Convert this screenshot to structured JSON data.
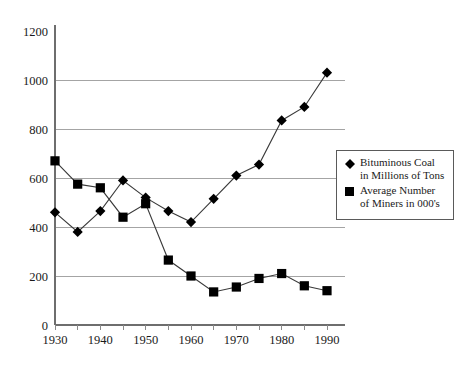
{
  "chart_data": {
    "type": "line",
    "title": "",
    "subtitle": "",
    "xlabel": "",
    "ylabel": "",
    "x": [
      1930,
      1935,
      1940,
      1945,
      1950,
      1955,
      1960,
      1965,
      1970,
      1975,
      1980,
      1985,
      1990
    ],
    "xlim": [
      1930,
      1990
    ],
    "ylim": [
      0,
      1200
    ],
    "y_ticks": [
      0,
      200,
      400,
      600,
      800,
      1000,
      1200
    ],
    "y_tick_labels": [
      "0",
      "200",
      "400",
      "600",
      "800",
      "1000",
      "1200"
    ],
    "x_ticks": [
      1930,
      1935,
      1940,
      1945,
      1950,
      1955,
      1960,
      1965,
      1970,
      1975,
      1980,
      1985,
      1990
    ],
    "x_tick_labels": [
      "1930",
      "",
      "1940",
      "",
      "1950",
      "",
      "1960",
      "",
      "1970",
      "",
      "1980",
      "",
      "1990"
    ],
    "x_major_labels": [
      "1930",
      "1940",
      "1950",
      "1960",
      "1970",
      "1980",
      "1990"
    ],
    "grid": "horizontal",
    "legend_position": "right",
    "series": [
      {
        "name": "Bituminous Coal in Millions of Tons",
        "marker": "diamond",
        "color": "#000000",
        "values": [
          460,
          380,
          465,
          590,
          520,
          465,
          420,
          515,
          610,
          655,
          835,
          890,
          1030
        ]
      },
      {
        "name": "Average Number of Miners in 000's",
        "marker": "square",
        "color": "#000000",
        "values": [
          670,
          575,
          560,
          440,
          495,
          265,
          200,
          135,
          155,
          190,
          210,
          160,
          140
        ]
      }
    ]
  },
  "legend": {
    "entries": [
      {
        "marker": "diamond",
        "line1": "Bituminous Coal",
        "line2": "in Millions of Tons"
      },
      {
        "marker": "square",
        "line1": "Average Number",
        "line2": "of Miners in 000's"
      }
    ]
  },
  "colors": {
    "marker": "#000000",
    "series_line": "#3a3a3a",
    "gridline": "#9a9a9a",
    "axis": "#6e6e6e",
    "background": "#ffffff",
    "text": "#1a1a1a"
  }
}
